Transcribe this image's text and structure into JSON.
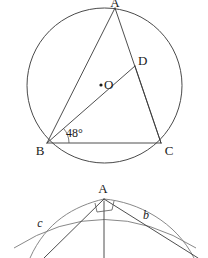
{
  "page": {
    "background_color": "#ffffff",
    "ink_color": "#1b1b1b",
    "line_color": "#3a3a3a"
  },
  "figures": [
    {
      "id": "circle-inscribed-triangle",
      "type": "circle-with-inscribed-triangle",
      "labels": {
        "apex": "A",
        "left_vertex": "B",
        "right_vertex": "C",
        "center": "O",
        "point_d": "D",
        "angle": "48°"
      },
      "geometry": {
        "circle_center_x": 104.5,
        "circle_center_y": 85.5,
        "circle_radius": 77.5,
        "point_a_x": 115,
        "point_a_y": 8,
        "point_b_x": 47,
        "point_b_y": 143,
        "point_c_x": 161,
        "point_c_y": 143,
        "point_d_x": 135,
        "point_d_y": 66,
        "angle_value": 48,
        "angle_unit": "degrees",
        "angle_vertex": "B",
        "center_dot_x": 101,
        "center_dot_y": 85
      }
    },
    {
      "id": "right-triangle-with-arcs",
      "type": "triangle-with-right-angle-and-arcs",
      "labels": {
        "apex": "A",
        "side_left": "c",
        "side_right": "b"
      },
      "geometry": {
        "apex_x": 104,
        "apex_y": 199,
        "right_angle_size": 9,
        "altitude_bottom_y": 258,
        "left_foot_x": 58,
        "right_foot_x": 176,
        "arc_left_label_x": 40,
        "arc_left_label_y": 227,
        "arc_right_label_x": 146,
        "arc_right_label_y": 219
      }
    }
  ]
}
